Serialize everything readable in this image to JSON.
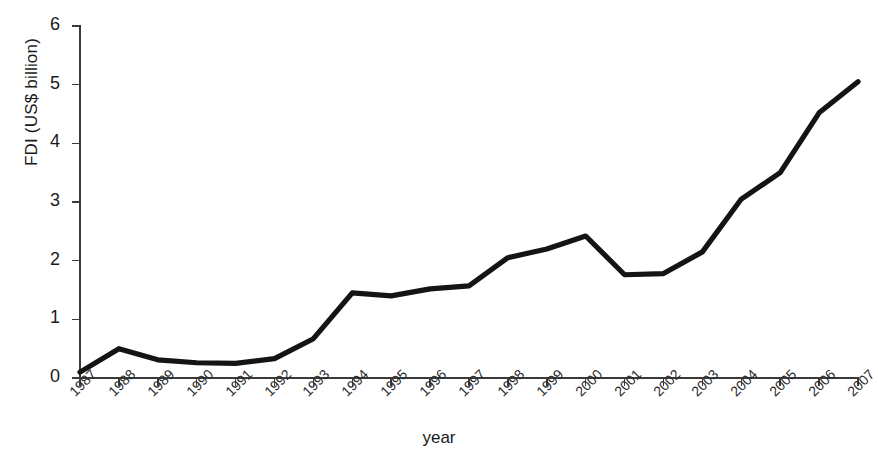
{
  "chart_data": {
    "type": "line",
    "title": "",
    "xlabel": "year",
    "ylabel": "FDI (US$ billion)",
    "categories": [
      "1987",
      "1988",
      "1989",
      "1990",
      "1991",
      "1992",
      "1993",
      "1994",
      "1995",
      "1996",
      "1997",
      "1998",
      "1999",
      "2000",
      "2001",
      "2002",
      "2003",
      "2004",
      "2005",
      "2006",
      "2007"
    ],
    "values": [
      0.1,
      0.5,
      0.31,
      0.26,
      0.25,
      0.33,
      0.67,
      1.45,
      1.4,
      1.52,
      1.57,
      2.05,
      2.2,
      2.42,
      1.76,
      1.78,
      2.15,
      3.05,
      3.5,
      4.52,
      5.05
    ],
    "series": [
      {
        "name": "FDI",
        "values": [
          0.1,
          0.5,
          0.31,
          0.26,
          0.25,
          0.33,
          0.67,
          1.45,
          1.4,
          1.52,
          1.57,
          2.05,
          2.2,
          2.42,
          1.76,
          1.78,
          2.15,
          3.05,
          3.5,
          4.52,
          5.05
        ],
        "color": "#141414"
      }
    ],
    "ylim": [
      0,
      6
    ],
    "ytick_labels": [
      "0",
      "1",
      "2",
      "3",
      "4",
      "5",
      "6"
    ],
    "ytick_values": [
      0,
      1,
      2,
      3,
      4,
      5,
      6
    ],
    "grid": false,
    "legend": "none",
    "line_color": "#141414",
    "axis_color": "#3a3a3a",
    "background": "#ffffff"
  }
}
